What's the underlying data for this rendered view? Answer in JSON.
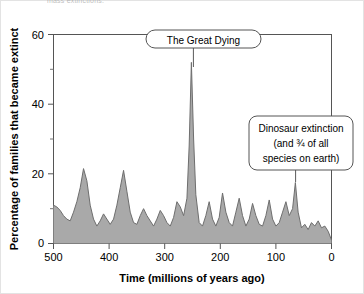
{
  "figure": {
    "cropped_header_text": "mass extinctions."
  },
  "chart_data": {
    "type": "area",
    "title": "",
    "xlabel": "Time  (millions of years ago)",
    "ylabel": "Percentage of families that became extinct",
    "xlim": [
      500,
      0
    ],
    "ylim": [
      0,
      60
    ],
    "x_reversed": true,
    "grid": false,
    "legend": "none",
    "fill_color": "#a9a9a9",
    "line_color": "#6e6e6e",
    "xticks": [
      500,
      400,
      300,
      200,
      100,
      0
    ],
    "xtick_labels": [
      "500",
      "400",
      "300",
      "200",
      "100",
      "0"
    ],
    "yticks": [
      0,
      20,
      40,
      60
    ],
    "ytick_labels": [
      "0",
      "20",
      "40",
      "60"
    ],
    "y_minor_ticks": [
      10,
      30,
      50
    ],
    "x": [
      500,
      494,
      488,
      482,
      476,
      470,
      464,
      458,
      452,
      446,
      440,
      434,
      428,
      422,
      416,
      410,
      404,
      398,
      392,
      386,
      380,
      374,
      368,
      362,
      356,
      350,
      344,
      338,
      332,
      326,
      320,
      314,
      308,
      302,
      296,
      290,
      284,
      278,
      272,
      266,
      260,
      256,
      252,
      248,
      244,
      238,
      232,
      226,
      220,
      214,
      208,
      202,
      196,
      190,
      184,
      178,
      172,
      166,
      160,
      154,
      148,
      142,
      136,
      130,
      124,
      118,
      112,
      106,
      100,
      94,
      88,
      82,
      76,
      70,
      65,
      60,
      54,
      48,
      42,
      36,
      30,
      24,
      18,
      12,
      6,
      0
    ],
    "y": [
      11,
      10.5,
      9.5,
      8,
      7,
      6.5,
      9,
      12,
      16,
      21.5,
      18,
      11,
      7,
      5,
      6.5,
      8.5,
      7,
      5.5,
      7,
      11,
      16,
      21,
      15,
      9,
      6,
      5.5,
      8,
      10,
      8,
      6.5,
      5,
      7,
      9.5,
      8,
      6,
      5,
      7.5,
      12,
      10.5,
      8,
      13,
      28,
      52,
      30,
      14,
      6,
      5,
      8,
      12,
      7,
      5,
      7.5,
      14.5,
      9,
      6,
      5,
      9,
      13,
      8,
      5,
      7,
      11.5,
      8,
      5.5,
      5,
      8,
      12.5,
      7,
      5,
      6,
      9,
      12,
      8,
      10,
      17.5,
      9,
      4.5,
      5.5,
      4,
      6,
      5,
      6.5,
      4.5,
      5,
      3.5,
      1
    ],
    "annotations": [
      {
        "name": "the-great-dying",
        "lines": [
          "The Great Dying"
        ],
        "points_to_x": 252,
        "points_to_y": 52
      },
      {
        "name": "dinosaur-extinction",
        "lines": [
          "Dinosaur extinction",
          "(and ¾ of all",
          "species on earth)"
        ],
        "points_to_x": 65,
        "points_to_y": 17.5
      }
    ]
  }
}
